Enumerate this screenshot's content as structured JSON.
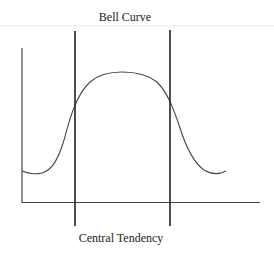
{
  "diagram": {
    "title": "Bell Curve",
    "caption": "Central Tendency",
    "colors": {
      "line": "#222222",
      "curve": "#444444",
      "rule": "#e6e6e6",
      "background": "#ffffff"
    },
    "elements": [
      {
        "type": "y-axis",
        "description": "vertical axis on left"
      },
      {
        "type": "x-axis",
        "description": "horizontal axis at bottom"
      },
      {
        "type": "bell-curve",
        "description": "flat-topped bell-shaped curve"
      },
      {
        "type": "boundary-line",
        "position": "left",
        "description": "vertical line marking left boundary of central tendency"
      },
      {
        "type": "boundary-line",
        "position": "right",
        "description": "vertical line marking right boundary of central tendency"
      }
    ]
  }
}
